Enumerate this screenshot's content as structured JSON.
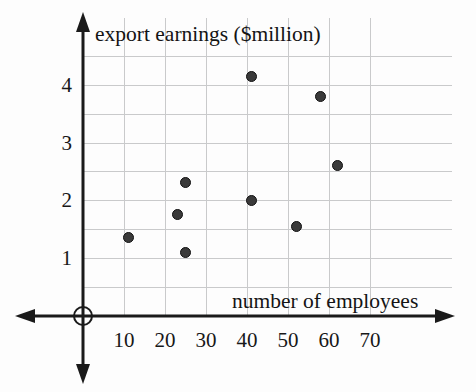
{
  "chart_data": {
    "type": "scatter",
    "title": "",
    "xlabel": "number of employees",
    "ylabel": "export earnings ($million)",
    "xlim": [
      0,
      78
    ],
    "ylim": [
      0,
      4.7
    ],
    "grid": true,
    "legend": null,
    "xticks": [
      10,
      20,
      30,
      40,
      50,
      60,
      70
    ],
    "yticks": [
      1,
      2,
      3,
      4
    ],
    "xtick_labels": [
      "10",
      "20",
      "30",
      "40",
      "50",
      "60",
      "70"
    ],
    "ytick_labels": [
      "1",
      "2",
      "3",
      "4"
    ],
    "origin_label": "O",
    "point_color": "#3a3a3a",
    "grid_color": "#c9cacb",
    "axis_color": "#1a1a1a",
    "points": [
      {
        "x": 11,
        "y": 1.35
      },
      {
        "x": 23,
        "y": 1.75
      },
      {
        "x": 25,
        "y": 2.3
      },
      {
        "x": 25,
        "y": 1.1
      },
      {
        "x": 41,
        "y": 4.15
      },
      {
        "x": 41,
        "y": 2.0
      },
      {
        "x": 52,
        "y": 1.55
      },
      {
        "x": 58,
        "y": 3.8
      },
      {
        "x": 62,
        "y": 2.6
      }
    ]
  },
  "labels": {
    "y_axis_title": "export earnings ($million)",
    "x_axis_title": "number of employees",
    "origin": "O"
  }
}
